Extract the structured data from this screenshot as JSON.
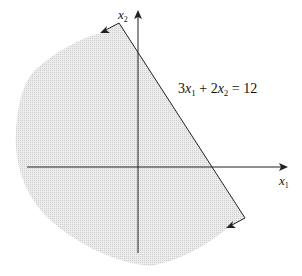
{
  "diagram": {
    "type": "half-plane-region",
    "constraint_label": "3x₁ + 2x₂ = 12",
    "constraint_parts": {
      "a": "3",
      "var1": "x",
      "sub1": "1",
      "op": " + ",
      "b": "2",
      "var2": "x",
      "sub2": "2",
      "rhs": " = 12"
    },
    "x_axis_label": {
      "var": "x",
      "sub": "1"
    },
    "y_axis_label": {
      "var": "x",
      "sub": "2"
    },
    "shaded_side": "below-left of line (3x₁ + 2x₂ ≤ 12)",
    "colors": {
      "shade": "#e4e4e4",
      "line": "#222222",
      "axis": "#222222"
    }
  }
}
